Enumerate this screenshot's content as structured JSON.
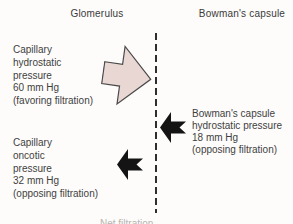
{
  "diagram": {
    "columns": {
      "left_header": "Glomerulus",
      "right_header": "Bowman's capsule"
    },
    "pressures": {
      "capillary_hydrostatic": {
        "lines": [
          "Capillary",
          "hydrostatic",
          "pressure",
          "60 mm Hg",
          "(favoring filtration)"
        ],
        "value": "60 mm Hg",
        "direction": "right",
        "effect": "favoring filtration"
      },
      "bowmans_capsule_hydrostatic": {
        "lines": [
          "Bowman's capsule",
          "hydrostatic pressure",
          "18 mm Hg",
          "(opposing filtration)"
        ],
        "value": "18 mm Hg",
        "direction": "left",
        "effect": "opposing filtration"
      },
      "capillary_oncotic": {
        "lines": [
          "Capillary",
          "oncotic",
          "pressure",
          "32 mm Hg",
          "(opposing filtration)"
        ],
        "value": "32 mm Hg",
        "direction": "left",
        "effect": "opposing filtration"
      }
    },
    "bottom_partial_text": "Net filtration",
    "colors": {
      "favoring_arrow_fill": "#e9d7d4",
      "favoring_arrow_stroke": "#4a4a4a",
      "opposing_arrow_fill": "#141414",
      "divider": "#2e2e2e",
      "text": "#3f3f3f"
    }
  }
}
